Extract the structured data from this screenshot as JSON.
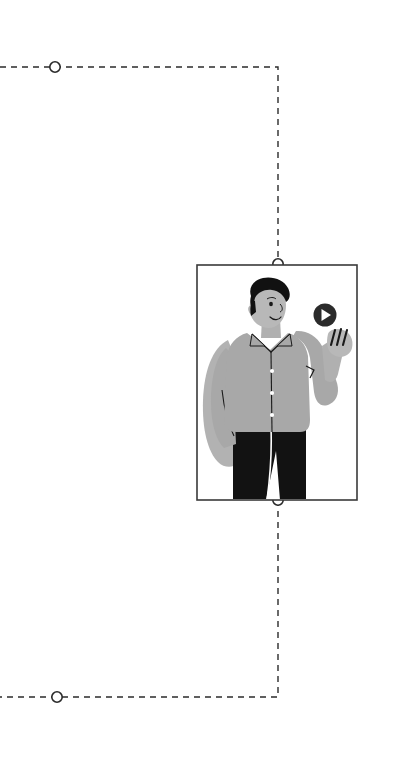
{
  "page": {
    "background_color": "#ffffff",
    "width": 774,
    "height": 774
  },
  "theme": {
    "line_color": "#2b2b2b",
    "node_stroke": "#2b2b2b",
    "node_fill": "#ffffff",
    "frame_color": "#3a3a3a",
    "skin_color": "#b8b8b8",
    "shirt_color": "#a8a8a8",
    "shirt_shadow": "#9d9d9d",
    "pants_color": "#121212",
    "hair_color": "#111111",
    "button_color": "#ffffff",
    "play_circle_color": "#2b2b2b",
    "play_triangle_color": "#ffffff",
    "detail_line_color": "#1a1a1a"
  },
  "connectors": {
    "dash_pattern": "6 5",
    "stroke_width": 1.4,
    "top_path": {
      "name": "top-connector-path",
      "description": "dashed line entering from left edge, running right then down to frame top",
      "points": "0,67 278,67 278,264"
    },
    "bottom_path": {
      "name": "bottom-connector-path",
      "description": "dashed line from frame bottom going down then left to left edge",
      "points": "278,500 278,697 0,697"
    }
  },
  "nodes": [
    {
      "id": "node-top-left",
      "label": "",
      "cx": 55,
      "cy": 67,
      "r": 5.2
    },
    {
      "id": "node-frame-top",
      "label": "",
      "cx": 278,
      "cy": 264,
      "r": 5.2
    },
    {
      "id": "node-frame-bottom",
      "label": "",
      "cx": 278,
      "cy": 500,
      "r": 5.2
    },
    {
      "id": "node-bottom-left",
      "label": "",
      "cx": 57,
      "cy": 697,
      "r": 5.2
    }
  ],
  "illustration_frame": {
    "name": "illustration-frame",
    "x": 197,
    "y": 265,
    "width": 160,
    "height": 235,
    "stroke_width": 1.6,
    "caption": ""
  },
  "illustration": {
    "name": "man-presenting-illustration",
    "alt": "Illustration of a man in a gray shirt and dark trousers gesturing toward a play button",
    "elements": [
      {
        "name": "hair",
        "kind": "shape"
      },
      {
        "name": "face",
        "kind": "shape"
      },
      {
        "name": "shirt",
        "kind": "shape"
      },
      {
        "name": "collar",
        "kind": "shape"
      },
      {
        "name": "shirt-buttons",
        "kind": "shape",
        "count": 3
      },
      {
        "name": "raised-arm",
        "kind": "shape"
      },
      {
        "name": "hand-fingers",
        "kind": "shape",
        "count": 3
      },
      {
        "name": "trousers",
        "kind": "shape"
      },
      {
        "name": "play-button-icon",
        "kind": "icon"
      }
    ]
  },
  "play_button": {
    "name": "play-button-icon",
    "cx": 325,
    "cy": 315,
    "r": 11.5,
    "label": ""
  }
}
